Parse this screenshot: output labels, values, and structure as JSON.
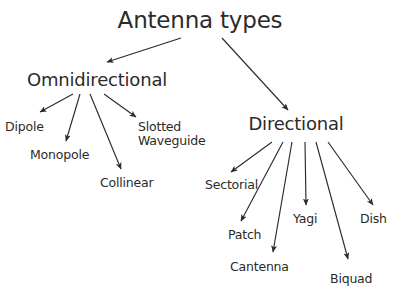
{
  "diagram": {
    "title": "Antenna types",
    "background_color": "#ffffff",
    "text_color": "#2b2b2b",
    "edge_color": "#2b2b2b",
    "width": 402,
    "height": 294,
    "nodes": {
      "root": {
        "label": "Antenna types",
        "x": 200,
        "y": 8,
        "level": "title"
      },
      "omnidirectional": {
        "label": "Omnidirectional",
        "x": 97,
        "y": 70,
        "level": "branch"
      },
      "directional": {
        "label": "Directional",
        "x": 296,
        "y": 114,
        "level": "branch"
      },
      "dipole": {
        "label": "Dipole",
        "x": 5,
        "y": 120,
        "level": "leaf"
      },
      "monopole": {
        "label": "Monopole",
        "x": 30,
        "y": 148,
        "level": "leaf"
      },
      "collinear": {
        "label": "Collinear",
        "x": 100,
        "y": 176,
        "level": "leaf"
      },
      "slotted_waveguide": {
        "label": "Slotted\nWaveguide",
        "x": 138,
        "y": 120,
        "level": "leaf"
      },
      "sectorial": {
        "label": "Sectorial",
        "x": 205,
        "y": 178,
        "level": "leaf"
      },
      "patch": {
        "label": "Patch",
        "x": 228,
        "y": 228,
        "level": "leaf"
      },
      "cantenna": {
        "label": "Cantenna",
        "x": 230,
        "y": 260,
        "level": "leaf"
      },
      "yagi": {
        "label": "Yagi",
        "x": 293,
        "y": 212,
        "level": "leaf"
      },
      "biquad": {
        "label": "Biquad",
        "x": 330,
        "y": 272,
        "level": "leaf"
      },
      "dish": {
        "label": "Dish",
        "x": 360,
        "y": 212,
        "level": "leaf"
      }
    },
    "edges": [
      {
        "from": "root",
        "to": "omnidirectional",
        "x1": 181,
        "y1": 38,
        "x2": 107,
        "y2": 62
      },
      {
        "from": "root",
        "to": "directional",
        "x1": 222,
        "y1": 38,
        "x2": 288,
        "y2": 110
      },
      {
        "from": "omnidirectional",
        "to": "dipole",
        "x1": 73,
        "y1": 94,
        "x2": 40,
        "y2": 112
      },
      {
        "from": "omnidirectional",
        "to": "monopole",
        "x1": 80,
        "y1": 94,
        "x2": 66,
        "y2": 141
      },
      {
        "from": "omnidirectional",
        "to": "collinear",
        "x1": 90,
        "y1": 94,
        "x2": 121,
        "y2": 169
      },
      {
        "from": "omnidirectional",
        "to": "slotted_waveguide",
        "x1": 104,
        "y1": 94,
        "x2": 136,
        "y2": 117
      },
      {
        "from": "directional",
        "to": "sectorial",
        "x1": 272,
        "y1": 142,
        "x2": 231,
        "y2": 172
      },
      {
        "from": "directional",
        "to": "patch",
        "x1": 283,
        "y1": 142,
        "x2": 241,
        "y2": 221
      },
      {
        "from": "directional",
        "to": "cantenna",
        "x1": 292,
        "y1": 142,
        "x2": 273,
        "y2": 252
      },
      {
        "from": "directional",
        "to": "yagi",
        "x1": 305,
        "y1": 142,
        "x2": 306,
        "y2": 205
      },
      {
        "from": "directional",
        "to": "biquad",
        "x1": 316,
        "y1": 142,
        "x2": 348,
        "y2": 259
      },
      {
        "from": "directional",
        "to": "dish",
        "x1": 328,
        "y1": 142,
        "x2": 373,
        "y2": 205
      }
    ]
  }
}
